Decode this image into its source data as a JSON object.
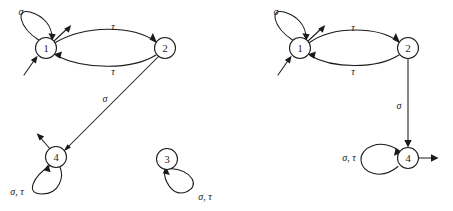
{
  "figure": {
    "type": "finite-state-automaton-pair",
    "stroke_color": "#1a1a1a",
    "background_color": "#ffffff",
    "alphabet": [
      "σ",
      "τ"
    ]
  },
  "automata": [
    {
      "id": "left",
      "name": "left-automaton",
      "states": [
        {
          "id": "L1",
          "label": "1",
          "cx": 46,
          "cy": 48,
          "r": 10.5
        },
        {
          "id": "L2",
          "label": "2",
          "cx": 165,
          "cy": 48,
          "r": 10.5
        },
        {
          "id": "L4",
          "label": "4",
          "cx": 56,
          "cy": 157,
          "r": 10.5
        },
        {
          "id": "L3",
          "label": "3",
          "cx": 167,
          "cy": 159,
          "r": 10.5
        }
      ],
      "transitions": [
        {
          "id": "L-self-1",
          "from": "L1",
          "to": "L1",
          "label": "σ",
          "label_x": 21,
          "label_y": 11,
          "kind": "self-loop-upper-left"
        },
        {
          "id": "L-1-to-2",
          "from": "L1",
          "to": "L2",
          "label": "τ",
          "label_x": 113,
          "label_y": 26,
          "kind": "curved-upper"
        },
        {
          "id": "L-2-to-1",
          "from": "L2",
          "to": "L1",
          "label": "τ",
          "label_x": 113,
          "label_y": 71,
          "kind": "curved-lower"
        },
        {
          "id": "L-2-to-4",
          "from": "L2",
          "to": "L4",
          "label": "σ",
          "label_x": 105,
          "label_y": 98,
          "kind": "straight-diagonal"
        },
        {
          "id": "L-self-4",
          "from": "L4",
          "to": "L4",
          "label": "σ, τ",
          "label_x": 17,
          "label_y": 191,
          "kind": "self-loop-lower-left"
        },
        {
          "id": "L-self-3",
          "from": "L3",
          "to": "L3",
          "label": "σ, τ",
          "label_x": 205,
          "label_y": 196,
          "kind": "self-loop-lower-right"
        }
      ],
      "stubs": [
        {
          "id": "L-in-1",
          "name": "incoming-stub-state-1",
          "kind": "incoming",
          "x1": 24,
          "y1": 75,
          "x2": 37,
          "y2": 57
        },
        {
          "id": "L-out-1",
          "name": "outgoing-stub-state-1",
          "kind": "outgoing",
          "x1": 53,
          "y1": 41,
          "x2": 72,
          "y2": 24
        },
        {
          "id": "L-out-4",
          "name": "outgoing-stub-state-4",
          "kind": "outgoing",
          "x1": 50,
          "y1": 149,
          "x2": 36,
          "y2": 133
        }
      ]
    },
    {
      "id": "right",
      "name": "right-automaton",
      "states": [
        {
          "id": "R1",
          "label": "1",
          "cx": 300,
          "cy": 48,
          "r": 10.5
        },
        {
          "id": "R2",
          "label": "2",
          "cx": 408,
          "cy": 48,
          "r": 10.5
        },
        {
          "id": "R4",
          "label": "4",
          "cx": 408,
          "cy": 158,
          "r": 10.5
        }
      ],
      "transitions": [
        {
          "id": "R-self-1",
          "from": "R1",
          "to": "R1",
          "label": "σ",
          "label_x": 276,
          "label_y": 11,
          "kind": "self-loop-upper-left"
        },
        {
          "id": "R-1-to-2",
          "from": "R1",
          "to": "R2",
          "label": "τ",
          "label_x": 353,
          "label_y": 27,
          "kind": "curved-upper"
        },
        {
          "id": "R-2-to-1",
          "from": "R2",
          "to": "R1",
          "label": "τ",
          "label_x": 353,
          "label_y": 71,
          "kind": "curved-lower"
        },
        {
          "id": "R-2-to-4",
          "from": "R2",
          "to": "R4",
          "label": "σ",
          "label_x": 399,
          "label_y": 105,
          "kind": "straight-vertical"
        },
        {
          "id": "R-self-4",
          "from": "R4",
          "to": "R4",
          "label": "σ, τ",
          "label_x": 349,
          "label_y": 157,
          "kind": "self-loop-left"
        }
      ],
      "stubs": [
        {
          "id": "R-in-1",
          "name": "incoming-stub-state-1",
          "kind": "incoming",
          "x1": 278,
          "y1": 75,
          "x2": 291,
          "y2": 57
        },
        {
          "id": "R-out-1",
          "name": "outgoing-stub-state-1",
          "kind": "outgoing",
          "x1": 307,
          "y1": 41,
          "x2": 326,
          "y2": 24
        },
        {
          "id": "R-out-4",
          "name": "outgoing-stub-state-4",
          "kind": "outgoing",
          "x1": 419,
          "y1": 158,
          "x2": 440,
          "y2": 158
        }
      ]
    }
  ]
}
